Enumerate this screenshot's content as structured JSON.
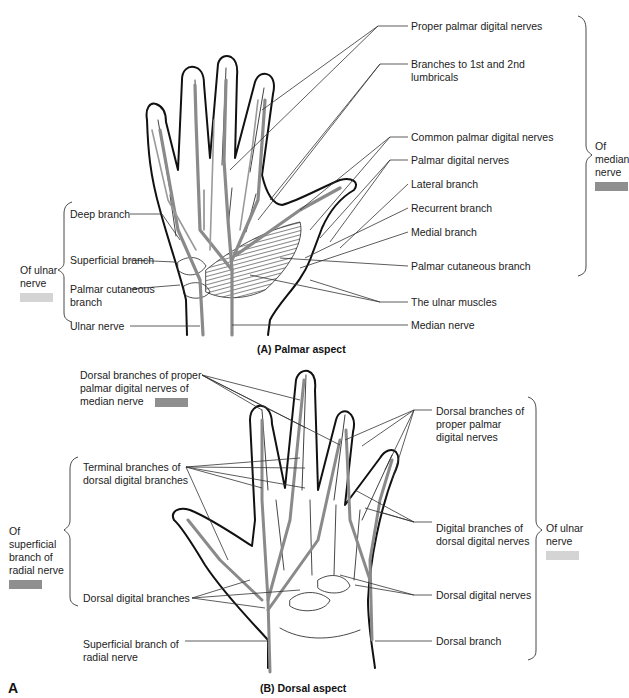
{
  "figure": {
    "panel_letter": "A",
    "colors": {
      "median_swatch": "#8f8f8f",
      "ulnar_swatch": "#d4d4d4",
      "radial_swatch": "#8f8f8f",
      "nerve_stroke": "#8a8a8a",
      "outline": "#111111"
    },
    "palmar": {
      "caption": "(A) Palmar aspect",
      "right_labels": [
        "Proper palmar digital nerves",
        "Branches to 1st and 2nd lumbricals",
        "Common palmar digital nerves",
        "Palmar digital nerves",
        "Lateral branch",
        "Recurrent branch",
        "Medial branch",
        "Palmar cutaneous branch",
        "The ulnar muscles",
        "Median nerve"
      ],
      "left_labels": [
        "Deep branch",
        "Superficial branch",
        "Palmar cutaneous branch",
        "Ulnar nerve"
      ],
      "group_median": "Of median nerve",
      "group_ulnar": "Of ulnar nerve"
    },
    "dorsal": {
      "caption": "(B) Dorsal aspect",
      "left_labels": [
        "Dorsal branches of proper palmar digital nerves of median nerve",
        "Terminal branches of dorsal digital branches",
        "Dorsal digital branches",
        "Superficial branch of radial nerve"
      ],
      "right_labels": [
        "Dorsal branches of proper palmar digital nerves",
        "Digital branches of dorsal digital nerves",
        "Dorsal digital nerves",
        "Dorsal branch"
      ],
      "group_radial": "Of superficial branch of radial nerve",
      "group_ulnar": "Of ulnar nerve"
    }
  }
}
